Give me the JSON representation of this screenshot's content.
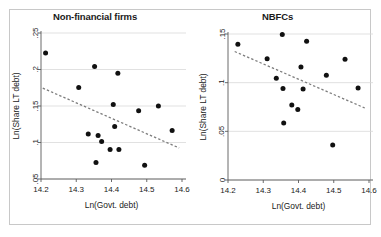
{
  "figure": {
    "width": 381,
    "height": 237,
    "background": "#ffffff",
    "frame_color": "#c8c8c8",
    "point_color": "#111111",
    "trend_color": "#7d7d7d",
    "grid_color": "#d9d9d9",
    "axis_color": "#5a5a5a"
  },
  "chart_data": [
    {
      "type": "scatter",
      "panel": "left",
      "title": "Non-financial firms",
      "xlabel": "Ln(Govt. debt)",
      "ylabel": "Ln(Share LT debt)",
      "xlim": [
        14.2,
        14.6
      ],
      "ylim": [
        0.05,
        0.25
      ],
      "xticks": [
        14.2,
        14.3,
        14.4,
        14.5,
        14.6
      ],
      "xticklabels": [
        "14.2",
        "14.3",
        "14.4",
        "14.5",
        "14.6"
      ],
      "yticks": [
        0.05,
        0.1,
        0.15,
        0.2,
        0.25
      ],
      "yticklabels": [
        ".05",
        ".1",
        ".15",
        ".2",
        ".25"
      ],
      "grid": true,
      "legend": "none",
      "points": [
        {
          "x": 14.213,
          "y": 0.2225
        },
        {
          "x": 14.307,
          "y": 0.1755
        },
        {
          "x": 14.334,
          "y": 0.1115
        },
        {
          "x": 14.352,
          "y": 0.204
        },
        {
          "x": 14.356,
          "y": 0.0725
        },
        {
          "x": 14.362,
          "y": 0.1095
        },
        {
          "x": 14.372,
          "y": 0.1015
        },
        {
          "x": 14.396,
          "y": 0.0905
        },
        {
          "x": 14.405,
          "y": 0.152
        },
        {
          "x": 14.409,
          "y": 0.122
        },
        {
          "x": 14.418,
          "y": 0.195
        },
        {
          "x": 14.421,
          "y": 0.0905
        },
        {
          "x": 14.477,
          "y": 0.1435
        },
        {
          "x": 14.494,
          "y": 0.069
        },
        {
          "x": 14.533,
          "y": 0.15
        },
        {
          "x": 14.572,
          "y": 0.1165
        }
      ],
      "trend": {
        "x0": 14.205,
        "y0": 0.1745,
        "x1": 14.592,
        "y1": 0.0925
      }
    },
    {
      "type": "scatter",
      "panel": "right",
      "title": "NBFCs",
      "xlabel": "Ln(Govt. debt)",
      "ylabel": "Ln(Share LT debt)",
      "xlim": [
        14.2,
        14.6
      ],
      "ylim": [
        0.0,
        0.15
      ],
      "xticks": [
        14.2,
        14.3,
        14.4,
        14.5,
        14.6
      ],
      "xticklabels": [
        "14.2",
        "14.3",
        "14.4",
        "14.5",
        "14.6"
      ],
      "yticks": [
        0.0,
        0.05,
        0.1,
        0.15
      ],
      "yticklabels": [
        "0",
        ".05",
        ".1",
        ".15"
      ],
      "grid": true,
      "legend": "none",
      "points": [
        {
          "x": 14.228,
          "y": 0.1395
        },
        {
          "x": 14.311,
          "y": 0.1245
        },
        {
          "x": 14.337,
          "y": 0.1045
        },
        {
          "x": 14.354,
          "y": 0.1495
        },
        {
          "x": 14.356,
          "y": 0.094
        },
        {
          "x": 14.358,
          "y": 0.0585
        },
        {
          "x": 14.381,
          "y": 0.077
        },
        {
          "x": 14.398,
          "y": 0.0725
        },
        {
          "x": 14.407,
          "y": 0.116
        },
        {
          "x": 14.413,
          "y": 0.0935
        },
        {
          "x": 14.423,
          "y": 0.1425
        },
        {
          "x": 14.479,
          "y": 0.1075
        },
        {
          "x": 14.497,
          "y": 0.036
        },
        {
          "x": 14.532,
          "y": 0.124
        },
        {
          "x": 14.569,
          "y": 0.0945
        }
      ],
      "trend": {
        "x0": 14.219,
        "y0": 0.132,
        "x1": 14.588,
        "y1": 0.074
      }
    }
  ]
}
